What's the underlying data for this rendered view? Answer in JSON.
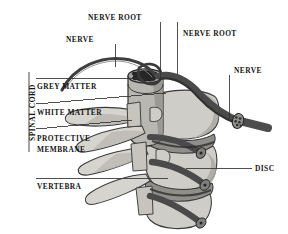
{
  "figure": {
    "background_color": "#ffffff",
    "text_color": "#151515",
    "line_color": "#333333",
    "bone_fill": "#c9c9c4",
    "bone_fill_light": "#dedcd6",
    "bone_shadow": "#a5a49e",
    "nerve_fill": "#5b5b5b",
    "nerve_dark": "#3a3a3a",
    "cord_fill": "#9a9a97",
    "grey_matter_fill": "#2b2b2b"
  },
  "labels": {
    "nerve_root_top": "NERVE ROOT",
    "nerve_top_left": "NERVE",
    "nerve_root_right": "NERVE ROOT",
    "nerve_right": "NERVE",
    "spinal_cord": "SPINAL CORD",
    "grey_matter": "GREY MATTER",
    "white_matter": "WHITE MATTER",
    "protective_membrane_line1": "PROTECTIVE",
    "protective_membrane_line2": "MEMBRANE",
    "vertebra": "VERTEBRA",
    "disc": "DISC"
  },
  "leader_lines": [
    {
      "name": "nerve-root-top-leader",
      "x1": 160,
      "y1": 22,
      "x2": 160,
      "y2": 78
    },
    {
      "name": "nerve-top-left-leader",
      "x1": 115,
      "y1": 44,
      "x2": 115,
      "y2": 66
    },
    {
      "name": "nerve-root-right-leader",
      "x1": 177,
      "y1": 22,
      "x2": 177,
      "y2": 74
    },
    {
      "name": "nerve-right-leader",
      "x1": 229,
      "y1": 75,
      "x2": 229,
      "y2": 117
    },
    {
      "name": "grey-matter-leader",
      "x1": 36,
      "y1": 78,
      "x2": 168,
      "y2": 78
    },
    {
      "name": "white-matter-leader",
      "x1": 36,
      "y1": 104,
      "x2": 166,
      "y2": 92
    },
    {
      "name": "protective-membrane-leader",
      "x1": 36,
      "y1": 129,
      "x2": 131,
      "y2": 120
    },
    {
      "name": "vertebra-leader",
      "x1": 36,
      "y1": 178,
      "x2": 168,
      "y2": 178
    },
    {
      "name": "disc-leader",
      "x1": 185,
      "y1": 168,
      "x2": 252,
      "y2": 168
    }
  ],
  "bracket": {
    "name": "spinal-cord-bracket",
    "x": 29,
    "y_top": 72,
    "y_bottom": 152
  }
}
